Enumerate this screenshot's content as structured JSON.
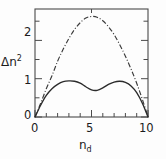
{
  "figure": {
    "background_color": "#fdfdfd",
    "line_color": "#2b2b2b",
    "axis_color": "#4a4a4a"
  },
  "axes": {
    "ylabel": "Δn",
    "ylabel_exponent": "2",
    "xlabel": "n",
    "xlabel_subscript": "d",
    "y_ticklabels": [
      "2",
      "1",
      "0"
    ],
    "x_ticklabels": [
      "0",
      "5",
      "10"
    ]
  },
  "chart_data": {
    "type": "line",
    "title": "",
    "xlabel": "n_d",
    "ylabel": "Δn²",
    "xlim": [
      0,
      10
    ],
    "ylim": [
      0,
      2.75
    ],
    "grid": false,
    "legend": null,
    "x_major_ticks": [
      0,
      5,
      10
    ],
    "x_minor_ticks": [
      1,
      2,
      3,
      4,
      6,
      7,
      8,
      9
    ],
    "y_major_ticks": [
      0,
      1,
      2
    ],
    "y_minor_ticks": [
      0.5,
      1.5,
      2.5
    ],
    "x": [
      0,
      0.5,
      1,
      1.5,
      2,
      2.5,
      3,
      3.5,
      4,
      4.5,
      5,
      5.5,
      6,
      6.5,
      7,
      7.5,
      8,
      8.5,
      9,
      9.5,
      10
    ],
    "series": [
      {
        "name": "upper-curve",
        "style": "dash-dot",
        "values": [
          0,
          0.35,
          0.72,
          1.05,
          1.42,
          1.73,
          2.0,
          2.23,
          2.4,
          2.52,
          2.56,
          2.54,
          2.45,
          2.3,
          2.1,
          1.84,
          1.55,
          1.22,
          0.86,
          0.45,
          0
        ]
      },
      {
        "name": "lower-curve",
        "style": "solid",
        "values": [
          0,
          0.3,
          0.55,
          0.72,
          0.83,
          0.9,
          0.92,
          0.91,
          0.86,
          0.77,
          0.69,
          0.68,
          0.74,
          0.83,
          0.89,
          0.91,
          0.88,
          0.79,
          0.62,
          0.35,
          0
        ]
      }
    ]
  }
}
